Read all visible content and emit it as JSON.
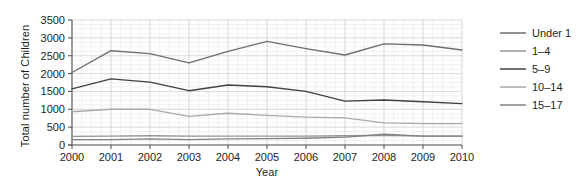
{
  "chart_data": {
    "type": "line",
    "title": "",
    "xlabel": "Year",
    "ylabel": "Total number of Children",
    "x": [
      2000,
      2001,
      2002,
      2003,
      2004,
      2005,
      2006,
      2007,
      2008,
      2009,
      2010
    ],
    "categories": [
      "2000",
      "2001",
      "2002",
      "2003",
      "2004",
      "2005",
      "2006",
      "2007",
      "2008",
      "2009",
      "2010"
    ],
    "xlim": [
      2000,
      2010
    ],
    "ylim": [
      0,
      3500
    ],
    "yticks": [
      0,
      500,
      1000,
      1500,
      2000,
      2500,
      3000,
      3500
    ],
    "ytick_labels": [
      "0",
      "500",
      "1000",
      "1500",
      "2000",
      "2500",
      "3000",
      "3500"
    ],
    "grid": true,
    "legend_position": "right",
    "series": [
      {
        "name": "Under 1",
        "color": "#6d6e71",
        "values": [
          2030,
          2640,
          2560,
          2300,
          2620,
          2900,
          2700,
          2520,
          2830,
          2800,
          2660
        ]
      },
      {
        "name": "1–4",
        "color": "#939598",
        "values": [
          240,
          250,
          260,
          250,
          250,
          250,
          250,
          260,
          270,
          250,
          250
        ]
      },
      {
        "name": "5–9",
        "color": "#414042",
        "values": [
          1570,
          1850,
          1760,
          1520,
          1680,
          1630,
          1500,
          1230,
          1260,
          1210,
          1160
        ]
      },
      {
        "name": "10–14",
        "color": "#a7a9ac",
        "values": [
          930,
          1000,
          1000,
          800,
          890,
          830,
          780,
          760,
          620,
          600,
          600
        ]
      },
      {
        "name": "15–17",
        "color": "#808285",
        "values": [
          150,
          150,
          170,
          150,
          170,
          180,
          190,
          220,
          300,
          250,
          250
        ]
      }
    ]
  },
  "axes": {
    "y_title": "Total number of Children",
    "x_title": "Year"
  },
  "legend": {
    "entries": [
      {
        "label": "Under 1",
        "color": "#6d6e71"
      },
      {
        "label": "1–4",
        "color": "#939598"
      },
      {
        "label": "5–9",
        "color": "#414042"
      },
      {
        "label": "10–14",
        "color": "#a7a9ac"
      },
      {
        "label": "15–17",
        "color": "#808285"
      }
    ]
  }
}
